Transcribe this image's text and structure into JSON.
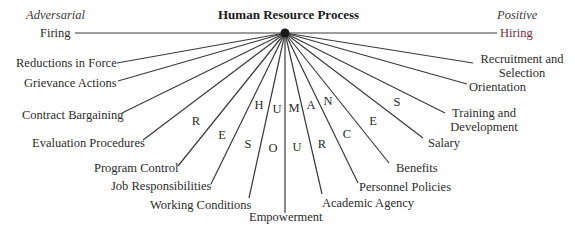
{
  "title": "Human Resource Process",
  "poles": {
    "left": "Adversarial",
    "right": "Positive"
  },
  "hub": {
    "x": 285,
    "y": 33,
    "color": "#1a1a1a"
  },
  "line_color": "#3a3a3a",
  "spokes": [
    {
      "label": "Firing",
      "x": 75,
      "y": 33
    },
    {
      "label": "Reductions in Force",
      "x": 117,
      "y": 63
    },
    {
      "label": "Grievance Actions",
      "x": 118,
      "y": 81
    },
    {
      "label": "Contract Bargaining",
      "x": 122,
      "y": 113
    },
    {
      "label": "Evaluation Procedures",
      "x": 143,
      "y": 140
    },
    {
      "label": "Program Control",
      "x": 178,
      "y": 166
    },
    {
      "label": "Job Responsibilities",
      "x": 211,
      "y": 184
    },
    {
      "label": "Working Conditions",
      "x": 249,
      "y": 198
    },
    {
      "label": "Empowerment",
      "x": 285,
      "y": 213
    },
    {
      "label": "Academic Agency",
      "x": 322,
      "y": 194
    },
    {
      "label": "Personnel Policies",
      "x": 358,
      "y": 183
    },
    {
      "label": "Benefits",
      "x": 389,
      "y": 163
    },
    {
      "label": "Salary",
      "x": 423,
      "y": 138
    },
    {
      "label": "Training and Development",
      "line1": "Training and",
      "line2": "Development",
      "x": 445,
      "y": 113
    },
    {
      "label": "Orientation",
      "x": 467,
      "y": 84
    },
    {
      "label": "Recruitment and Selection",
      "line1": "Recruitment and",
      "line2": "Selection",
      "x": 473,
      "y": 63
    },
    {
      "label": "Hiring",
      "x": 497,
      "y": 33
    }
  ],
  "arc_words": {
    "top": "HUMAN",
    "bottom": "RESOURCES"
  },
  "arc_letters": [
    {
      "ch": "H",
      "x": 259,
      "y": 105
    },
    {
      "ch": "U",
      "x": 277,
      "y": 109
    },
    {
      "ch": "M",
      "x": 294,
      "y": 108
    },
    {
      "ch": "A",
      "x": 311,
      "y": 105
    },
    {
      "ch": "N",
      "x": 328,
      "y": 101
    },
    {
      "ch": "R",
      "x": 196,
      "y": 121
    },
    {
      "ch": "E",
      "x": 222,
      "y": 135
    },
    {
      "ch": "S",
      "x": 248,
      "y": 144
    },
    {
      "ch": "O",
      "x": 273,
      "y": 148
    },
    {
      "ch": "U",
      "x": 297,
      "y": 147
    },
    {
      "ch": "R",
      "x": 322,
      "y": 144
    },
    {
      "ch": "C",
      "x": 347,
      "y": 134
    },
    {
      "ch": "E",
      "x": 373,
      "y": 121
    },
    {
      "ch": "S",
      "x": 397,
      "y": 102
    }
  ]
}
